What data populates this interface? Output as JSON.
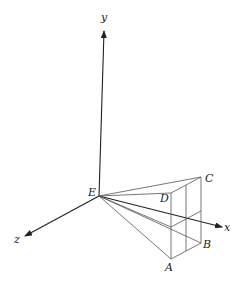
{
  "diagram": {
    "type": "3d-perspective-frustum",
    "axes": {
      "x_label": "x",
      "y_label": "y",
      "z_label": "z"
    },
    "points": {
      "E": "E",
      "A": "A",
      "B": "B",
      "C": "C",
      "D": "D"
    },
    "colors": {
      "line": "#555555",
      "axis": "#222222",
      "background": "#ffffff"
    }
  }
}
